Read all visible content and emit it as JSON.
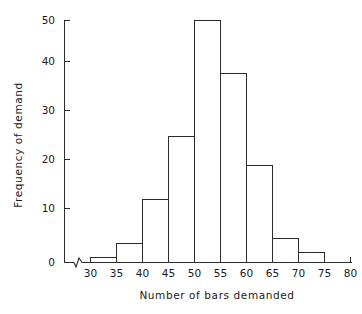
{
  "chart_data": {
    "type": "bar",
    "title": "",
    "subtitle": "",
    "xlabel": "Number of bars demanded",
    "ylabel": "Frequency of demand",
    "categories": [
      "30-35",
      "35-40",
      "40-45",
      "45-50",
      "50-55",
      "55-60",
      "60-65",
      "65-70",
      "70-75"
    ],
    "bin_edges": [
      30,
      35,
      40,
      45,
      50,
      55,
      60,
      65,
      70,
      75
    ],
    "values": [
      1,
      4,
      13,
      26,
      50,
      39,
      20,
      5,
      2
    ],
    "bin_width": 5,
    "xlim": [
      30,
      80
    ],
    "ylim": [
      0,
      50
    ],
    "xticks": [
      30,
      35,
      40,
      45,
      50,
      55,
      60,
      65,
      70,
      75,
      80
    ],
    "yticks": [
      0,
      10,
      20,
      30,
      40,
      50
    ],
    "xtick_labels": [
      "30",
      "35",
      "40",
      "45",
      "50",
      "55",
      "60",
      "65",
      "70",
      "75",
      "80"
    ],
    "ytick_labels": [
      "0",
      "10",
      "20",
      "30",
      "40",
      "50"
    ],
    "grid": false,
    "legend": false,
    "legend_position": "none",
    "axis_break_x": true,
    "line_color": "#2b2b2b",
    "fill_color": "none",
    "background_color": "#ffffff"
  },
  "labels": {
    "y_axis_title": "Frequency of demand",
    "x_axis_title": "Number of bars demanded"
  }
}
